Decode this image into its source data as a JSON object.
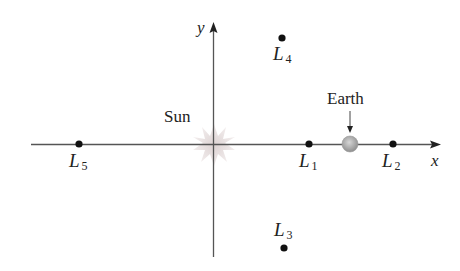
{
  "diagram": {
    "axes": {
      "x_label": "x",
      "y_label": "y"
    },
    "bodies": {
      "sun": {
        "label": "Sun"
      },
      "earth": {
        "label": "Earth"
      }
    },
    "lagrange_points": [
      {
        "name": "L1",
        "letter": "L",
        "sub": "1"
      },
      {
        "name": "L2",
        "letter": "L",
        "sub": "2"
      },
      {
        "name": "L3",
        "letter": "L",
        "sub": "3"
      },
      {
        "name": "L4",
        "letter": "L",
        "sub": "4"
      },
      {
        "name": "L5",
        "letter": "L",
        "sub": "5"
      }
    ],
    "colors": {
      "axis": "#555555",
      "point": "#111111",
      "sun": "#e6dede",
      "earth": "#a8a8a8",
      "text": "#222222"
    }
  }
}
